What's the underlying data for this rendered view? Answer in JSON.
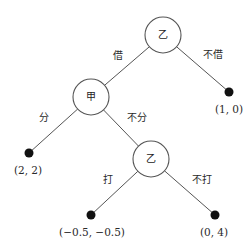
{
  "diagram": {
    "type": "game-tree",
    "nodes": [
      {
        "id": "root",
        "player": "乙",
        "x": 163,
        "y": 35,
        "r": 18
      },
      {
        "id": "jia",
        "player": "甲",
        "x": 91,
        "y": 97,
        "r": 18
      },
      {
        "id": "yi2",
        "player": "乙",
        "x": 151,
        "y": 159,
        "r": 18
      }
    ],
    "terminals": [
      {
        "id": "t_not_borrow",
        "payoff": "(1, 0)",
        "x": 229,
        "y": 92,
        "lx": 229,
        "ly": 109
      },
      {
        "id": "t_share",
        "payoff": "(2, 2)",
        "x": 29,
        "y": 153,
        "lx": 28,
        "ly": 170
      },
      {
        "id": "t_fight",
        "payoff": "(−0.5, −0.5)",
        "x": 91,
        "y": 215,
        "lx": 92,
        "ly": 232
      },
      {
        "id": "t_not_fight",
        "payoff": "(0, 4)",
        "x": 215,
        "y": 215,
        "lx": 214,
        "ly": 232
      }
    ],
    "edges": [
      {
        "from": "root",
        "to": "jia",
        "label": "借",
        "lx": 118,
        "ly": 56
      },
      {
        "from": "root",
        "to": "t_not_borrow",
        "label": "不借",
        "lx": 213,
        "ly": 55
      },
      {
        "from": "jia",
        "to": "t_share",
        "label": "分",
        "lx": 44,
        "ly": 118
      },
      {
        "from": "jia",
        "to": "yi2",
        "label": "不分",
        "lx": 137,
        "ly": 118
      },
      {
        "from": "yi2",
        "to": "t_fight",
        "label": "打",
        "lx": 108,
        "ly": 180
      },
      {
        "from": "yi2",
        "to": "t_not_fight",
        "label": "不打",
        "lx": 202,
        "ly": 180
      }
    ],
    "colors": {
      "line": "#555555",
      "node_fill": "#ffffff",
      "terminal": "#111111"
    }
  }
}
